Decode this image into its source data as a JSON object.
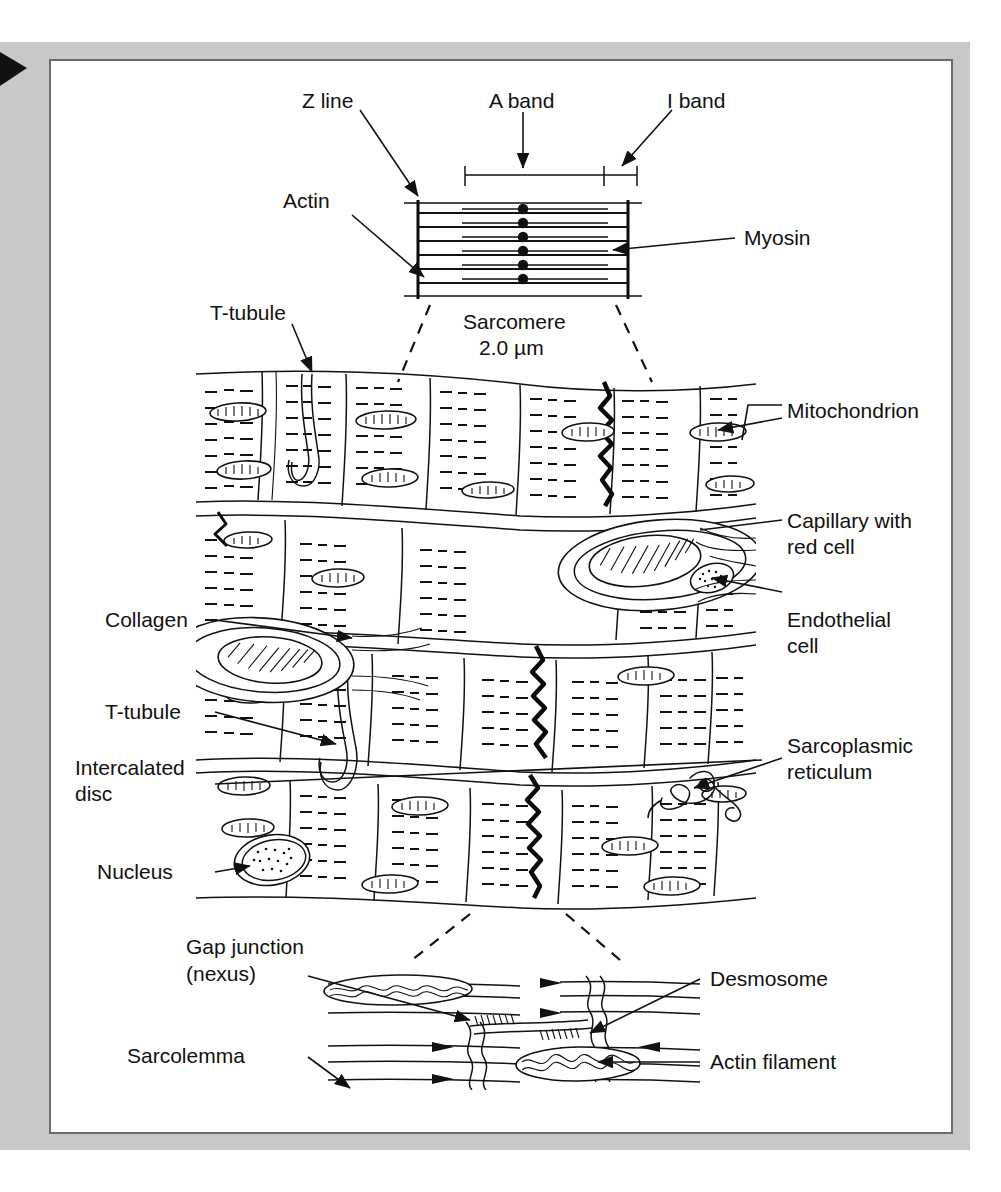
{
  "page": {
    "frame_color": "#c8c8c8",
    "frame_border_color": "#6b6b6b",
    "panel_color": "#ffffff",
    "ink_color": "#111111",
    "marker": "black-right-triangle"
  },
  "sarcomere_panel": {
    "labels": {
      "z_line": "Z line",
      "a_band": "A band",
      "i_band": "I band",
      "actin": "Actin",
      "myosin": "Myosin"
    },
    "caption_line1": "Sarcomere",
    "caption_line2": "2.0 µm",
    "filament_rows": 6,
    "thick_filament_label": "myosin-thick-filament",
    "thin_filament_label": "actin-thin-filament"
  },
  "main_panel": {
    "left_labels": [
      {
        "id": "t-tubule-top",
        "text": "T-tubule"
      },
      {
        "id": "collagen",
        "text": "Collagen"
      },
      {
        "id": "t-tubule-lower",
        "text": "T-tubule"
      },
      {
        "id": "intercalated-disc",
        "text": "Intercalated",
        "text2": "disc"
      },
      {
        "id": "nucleus",
        "text": "Nucleus"
      }
    ],
    "right_labels": [
      {
        "id": "mitochondrion",
        "text": "Mitochondrion"
      },
      {
        "id": "capillary",
        "text": "Capillary with",
        "text2": "red cell"
      },
      {
        "id": "endothelial-cell",
        "text": "Endothelial",
        "text2": "cell"
      },
      {
        "id": "sarcoplasmic-reticulum",
        "text": "Sarcoplasmic",
        "text2": "reticulum"
      }
    ]
  },
  "inset_panel": {
    "left_labels": [
      {
        "id": "gap-junction",
        "text": "Gap junction",
        "text2": "(nexus)"
      },
      {
        "id": "sarcolemma",
        "text": "Sarcolemma"
      }
    ],
    "right_labels": [
      {
        "id": "desmosome",
        "text": "Desmosome"
      },
      {
        "id": "actin-filament",
        "text": "Actin filament"
      }
    ]
  }
}
